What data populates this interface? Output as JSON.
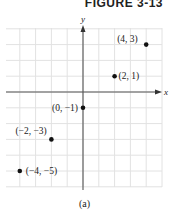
{
  "figure": {
    "title": "FIGURE 3-13",
    "caption": "(a)"
  },
  "chart_data": {
    "type": "scatter",
    "title": "FIGURE 3-13",
    "subtitle": "(a)",
    "xlabel": "x",
    "ylabel": "y",
    "xlim": [
      -5,
      5
    ],
    "ylim": [
      -6,
      4
    ],
    "grid": true,
    "points": [
      {
        "x": 4,
        "y": 3,
        "label": "(4, 3)"
      },
      {
        "x": 2,
        "y": 1,
        "label": "(2, 1)"
      },
      {
        "x": 0,
        "y": -1,
        "label": "(0, −1)"
      },
      {
        "x": -2,
        "y": -3,
        "label": "(−2, −3)"
      },
      {
        "x": -4,
        "y": -5,
        "label": "(−4, −5)"
      }
    ]
  },
  "colors": {
    "grid": "#e2e2e2",
    "axis": "#555555",
    "point": "#111111"
  }
}
